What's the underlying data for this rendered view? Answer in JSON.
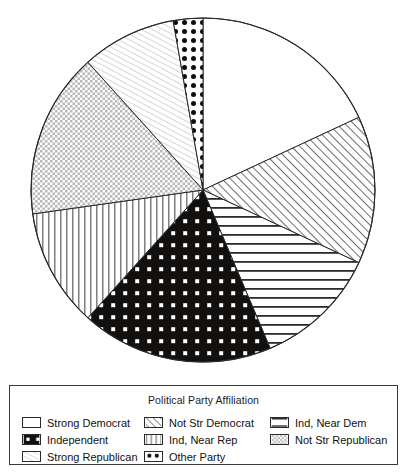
{
  "legend": {
    "title": "Political Party Affiliation",
    "entries": [
      {
        "label": "Strong Democrat",
        "pattern": "solid-white",
        "col": 1,
        "row": 1
      },
      {
        "label": "Not Str Democrat",
        "pattern": "diagonal-up",
        "col": 2,
        "row": 1
      },
      {
        "label": "Ind, Near Dem",
        "pattern": "horizontal-lines",
        "col": 3,
        "row": 1
      },
      {
        "label": "Independent",
        "pattern": "black-white-dots",
        "col": 1,
        "row": 2
      },
      {
        "label": "Ind, Near Rep",
        "pattern": "vertical-lines",
        "col": 2,
        "row": 2
      },
      {
        "label": "Not Str Republican",
        "pattern": "crosshatch-grid",
        "col": 3,
        "row": 2
      },
      {
        "label": "Strong Republican",
        "pattern": "diagonal-down-fine",
        "col": 1,
        "row": 3
      },
      {
        "label": "Other Party",
        "pattern": "white-black-dots",
        "col": 2,
        "row": 3
      }
    ]
  },
  "chart_data": {
    "type": "pie",
    "title": "Political Party Affiliation",
    "xlabel": "",
    "ylabel": "",
    "start_angle_deg": 0,
    "direction": "clockwise",
    "units": "degrees",
    "center": {
      "x": 203,
      "y": 190
    },
    "radius": 172,
    "categories": [
      "Strong Democrat",
      "Not Str Democrat",
      "Ind, Near Dem",
      "Independent",
      "Ind, Near Rep",
      "Not Str Republican",
      "Strong Republican",
      "Other Party"
    ],
    "values": [
      65,
      50,
      42,
      65,
      40,
      56,
      32,
      10
    ],
    "percents": [
      18.1,
      13.9,
      11.7,
      18.1,
      11.1,
      15.6,
      8.9,
      2.8
    ],
    "patterns": [
      "solid-white",
      "diagonal-up",
      "horizontal-lines",
      "black-white-dots",
      "vertical-lines",
      "crosshatch-grid",
      "diagonal-down-fine",
      "white-black-dots"
    ],
    "legend_position": "bottom",
    "grid": false,
    "colors": {
      "outline": "#2a2a2a",
      "fill_light": "#ffffff",
      "fill_dark": "#111111",
      "hatch": "#555555"
    }
  }
}
